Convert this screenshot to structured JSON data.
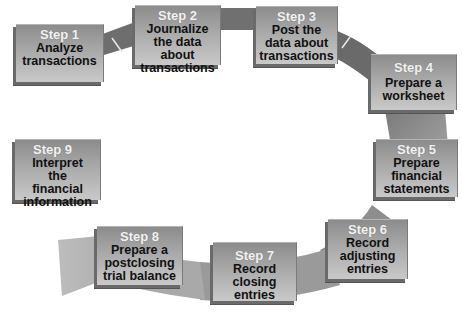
{
  "diagram": {
    "type": "cycle",
    "colors": {
      "band": "#8a8a8a",
      "band_light": "#b4b4b4",
      "box_top": "#8c8c8c",
      "box_bottom": "#c9c9c9",
      "step_label": "#f2f2f2",
      "desc_text": "#111111"
    },
    "steps": [
      {
        "label": "Step 1",
        "desc": "Analyze transactions"
      },
      {
        "label": "Step 2",
        "desc": "Journalize the data about transactions"
      },
      {
        "label": "Step 3",
        "desc": "Post the data about transactions"
      },
      {
        "label": "Step 4",
        "desc": "Prepare a worksheet"
      },
      {
        "label": "Step 5",
        "desc": "Prepare financial statements"
      },
      {
        "label": "Step 6",
        "desc": "Record adjusting entries"
      },
      {
        "label": "Step 7",
        "desc": "Record closing entries"
      },
      {
        "label": "Step 8",
        "desc": "Prepare a postclosing trial balance"
      },
      {
        "label": "Step 9",
        "desc": "Interpret the financial information"
      }
    ]
  }
}
